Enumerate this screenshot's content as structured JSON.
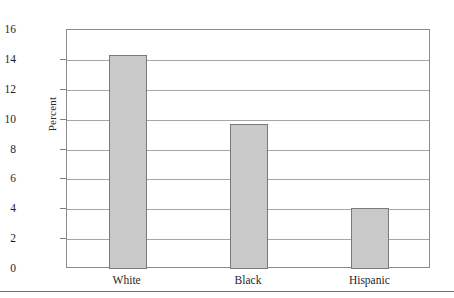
{
  "chart_data": {
    "type": "bar",
    "title": "",
    "subtitle": "",
    "xlabel": "",
    "ylabel": "Percent",
    "categories": [
      "White",
      "Black",
      "Hispanic"
    ],
    "values": [
      14.3,
      9.7,
      4.1
    ],
    "ylim": [
      0,
      16
    ],
    "ytick_labels": [
      "0",
      "2",
      "4",
      "6",
      "8",
      "10",
      "12",
      "14",
      "16"
    ],
    "ytick_values": [
      0,
      2,
      4,
      6,
      8,
      10,
      12,
      14,
      16
    ],
    "grid": "horizontal",
    "legend": "none",
    "bar_color": "#c9c9c9",
    "bar_border_color": "#7a7a7a",
    "gridline_color": "#a6a6a6",
    "axis_color": "#8b8b8b"
  }
}
